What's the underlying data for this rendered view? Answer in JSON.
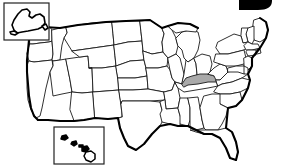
{
  "figure": {
    "name": "united-states-outline-map",
    "width": 285,
    "height": 167,
    "background_color": "#ffffff"
  },
  "style": {
    "state_fill": "#ffffff",
    "state_border_color": "#1a1a1a",
    "nation_outline_color": "#000000",
    "highlight_fill": "#a9a9a9",
    "inset_frame_color": "#222222"
  },
  "highlight": {
    "state_name": "Kentucky",
    "state_code": "KY",
    "fill_color": "#a9a9a9",
    "is_highlighted": true
  },
  "insets": [
    {
      "name": "alaska-inset",
      "label": "Alaska",
      "state_code": "AK",
      "position": "top-left",
      "frame": {
        "x": 4,
        "y": 3,
        "width": 45,
        "height": 37
      }
    },
    {
      "name": "hawaii-inset",
      "label": "Hawaii",
      "state_code": "HI",
      "position": "bottom-left",
      "frame": {
        "x": 54,
        "y": 127,
        "width": 50,
        "height": 37
      },
      "island_count": 5
    }
  ],
  "corner_mark": {
    "name": "cropped-label-mark",
    "description": "Partially cropped solid black letter shape at top right edge",
    "color": "#000000",
    "position": "top-right"
  },
  "regions": {
    "west": [
      "Washington",
      "Oregon",
      "California",
      "Idaho",
      "Nevada",
      "Utah",
      "Arizona",
      "Montana",
      "Wyoming",
      "Colorado",
      "New Mexico"
    ],
    "midwest": [
      "North Dakota",
      "South Dakota",
      "Nebraska",
      "Kansas",
      "Minnesota",
      "Iowa",
      "Missouri",
      "Wisconsin",
      "Illinois",
      "Michigan",
      "Indiana",
      "Ohio"
    ],
    "south": [
      "Oklahoma",
      "Texas",
      "Arkansas",
      "Louisiana",
      "Mississippi",
      "Alabama",
      "Tennessee",
      "Kentucky",
      "West Virginia",
      "Virginia",
      "North Carolina",
      "South Carolina",
      "Georgia",
      "Florida"
    ],
    "northeast": [
      "Maine",
      "New Hampshire",
      "Vermont",
      "New York",
      "Massachusetts",
      "Rhode Island",
      "Connecticut",
      "Pennsylvania",
      "New Jersey",
      "Delaware",
      "Maryland"
    ]
  }
}
